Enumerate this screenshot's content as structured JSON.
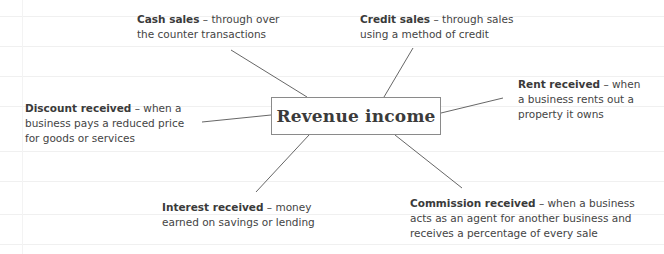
{
  "diagram": {
    "center": {
      "label": "Revenue income"
    },
    "nodes": [
      {
        "id": "cash-sales",
        "title": "Cash sales",
        "sep": " – ",
        "line1": "through over",
        "line2": "the counter transactions"
      },
      {
        "id": "credit-sales",
        "title": "Credit sales",
        "sep": " – ",
        "line1": "through sales",
        "line2": "using a method of credit"
      },
      {
        "id": "rent-received",
        "title": "Rent received",
        "sep": " – ",
        "line1": "when",
        "line2": "a business rents out a",
        "line3": "property it owns"
      },
      {
        "id": "discount-received",
        "title": "Discount received",
        "sep": " – ",
        "line1": "when a",
        "line2": "business pays a reduced price",
        "line3": "for goods or services"
      },
      {
        "id": "interest-received",
        "title": "Interest received",
        "sep": " – ",
        "line1": "money",
        "line2": "earned on savings or lending"
      },
      {
        "id": "commission-received",
        "title": "Commission received",
        "sep": " – ",
        "line1": "when a business",
        "line2": "acts as an agent for another business and",
        "line3": "receives a percentage of every sale"
      }
    ],
    "colors": {
      "line": "#555555",
      "box_border": "#8a8a8a",
      "text": "#444444"
    }
  }
}
